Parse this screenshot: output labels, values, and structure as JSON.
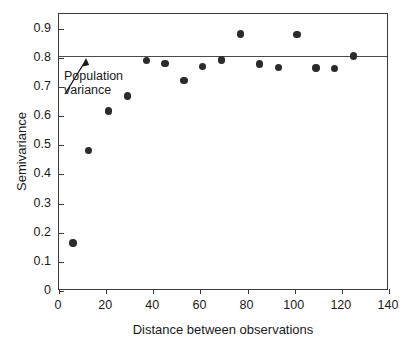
{
  "chart_data": {
    "type": "scatter",
    "title": "",
    "xlabel": "Distance between observations",
    "ylabel": "Semivariance",
    "xlim": [
      0,
      140
    ],
    "ylim": [
      0,
      0.95
    ],
    "xticks": [
      0,
      20,
      40,
      60,
      80,
      100,
      120,
      140
    ],
    "xtick_labels": [
      "0",
      "20",
      "40",
      "60",
      "80",
      "100",
      "120",
      "140"
    ],
    "yticks": [
      0,
      0.1,
      0.2,
      0.3,
      0.4,
      0.5,
      0.6,
      0.7,
      0.8,
      0.9
    ],
    "ytick_labels": [
      "0",
      "0.1",
      "0.2",
      "0.3",
      "0.4",
      "0.5",
      "0.6",
      "0.7",
      "0.8",
      "0.9"
    ],
    "grid": false,
    "legend": null,
    "marker_color": "#2b2b2b",
    "axis_color": "#3a3a3a",
    "x": [
      6,
      12.5,
      21,
      29,
      37,
      45,
      53,
      61,
      69,
      77,
      85,
      93,
      101,
      109,
      117,
      125
    ],
    "y": [
      0.165,
      0.481,
      0.617,
      0.669,
      0.79,
      0.781,
      0.721,
      0.769,
      0.792,
      0.881,
      0.779,
      0.767,
      0.879,
      0.765,
      0.764,
      0.806
    ],
    "points": [
      {
        "x": 6,
        "y": 0.165
      },
      {
        "x": 12.5,
        "y": 0.481
      },
      {
        "x": 21,
        "y": 0.617
      },
      {
        "x": 29,
        "y": 0.669
      },
      {
        "x": 37,
        "y": 0.79
      },
      {
        "x": 45,
        "y": 0.781
      },
      {
        "x": 53,
        "y": 0.721
      },
      {
        "x": 61,
        "y": 0.769
      },
      {
        "x": 69,
        "y": 0.792
      },
      {
        "x": 77,
        "y": 0.881
      },
      {
        "x": 85,
        "y": 0.779
      },
      {
        "x": 93,
        "y": 0.767
      },
      {
        "x": 101,
        "y": 0.879
      },
      {
        "x": 109,
        "y": 0.765
      },
      {
        "x": 117,
        "y": 0.764
      },
      {
        "x": 125,
        "y": 0.806
      }
    ],
    "reference_line": {
      "label": "Population variance",
      "value": 0.806,
      "orientation": "horizontal",
      "color": "#4a4a4a"
    },
    "annotations": [
      {
        "text": "Population variance",
        "text_line_1": "Population",
        "text_line_2": "variance",
        "points_to_x": 11,
        "points_to_y": 0.806
      }
    ]
  }
}
